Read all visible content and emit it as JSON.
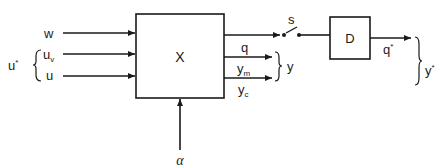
{
  "diagram": {
    "type": "block-diagram",
    "blocks": [
      {
        "id": "X",
        "label": "X"
      },
      {
        "id": "D",
        "label": "D"
      }
    ],
    "inputs": {
      "w": "w",
      "uv_base": "u",
      "uv_sub": "v",
      "u": "u",
      "group_label": "u",
      "group_sup": "*"
    },
    "outputs": {
      "q": "q",
      "ym_base": "y",
      "ym_sub": "m",
      "yc_base": "y",
      "yc_sub": "c",
      "group_y": "y"
    },
    "switch_label": "s",
    "q_star_base": "q",
    "q_star_sup": "*",
    "y_star_base": "y",
    "y_star_sup": "*",
    "alpha": "α"
  }
}
